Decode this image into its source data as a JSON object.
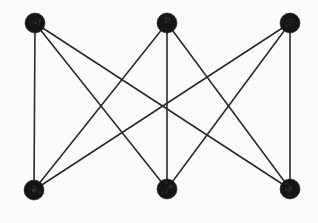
{
  "figure": {
    "name": "complete-bipartite-graph-k33",
    "background_color": "#fbfbfa",
    "edge_color": "#2b2b2b",
    "vertex_color": "#151515",
    "edge_stroke_width": 1.6,
    "vertex_radius": 10,
    "width": 318,
    "height": 223
  },
  "chart_data": {
    "type": "diagram",
    "graph_type": "complete bipartite graph K3,3",
    "title": "",
    "xlabel": "",
    "ylabel": "",
    "node_count": 6,
    "edge_count": 9,
    "partitions": [
      {
        "name": "top",
        "node_ids": [
          "t1",
          "t2",
          "t3"
        ]
      },
      {
        "name": "bottom",
        "node_ids": [
          "b1",
          "b2",
          "b3"
        ]
      }
    ],
    "nodes": [
      {
        "id": "t1",
        "label": "",
        "x": 35,
        "y": 23,
        "r": 10,
        "row": "top"
      },
      {
        "id": "t2",
        "label": "",
        "x": 167,
        "y": 23,
        "r": 10,
        "row": "top"
      },
      {
        "id": "t3",
        "label": "",
        "x": 290,
        "y": 23,
        "r": 10,
        "row": "top"
      },
      {
        "id": "b1",
        "label": "",
        "x": 34,
        "y": 190,
        "r": 10,
        "row": "bottom"
      },
      {
        "id": "b2",
        "label": "",
        "x": 167,
        "y": 189,
        "r": 10,
        "row": "bottom"
      },
      {
        "id": "b3",
        "label": "",
        "x": 290,
        "y": 189,
        "r": 10,
        "row": "bottom"
      }
    ],
    "edges": [
      {
        "id": "e1",
        "from": "t1",
        "to": "b1"
      },
      {
        "id": "e2",
        "from": "t1",
        "to": "b2"
      },
      {
        "id": "e3",
        "from": "t1",
        "to": "b3"
      },
      {
        "id": "e4",
        "from": "t2",
        "to": "b1"
      },
      {
        "id": "e5",
        "from": "t2",
        "to": "b2"
      },
      {
        "id": "e6",
        "from": "t2",
        "to": "b3"
      },
      {
        "id": "e7",
        "from": "t3",
        "to": "b1"
      },
      {
        "id": "e8",
        "from": "t3",
        "to": "b2"
      },
      {
        "id": "e9",
        "from": "t3",
        "to": "b3"
      }
    ]
  }
}
